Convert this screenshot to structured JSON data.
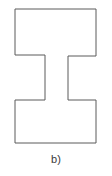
{
  "figure": {
    "caption": "b)",
    "shape_name": "i-beam-polygon",
    "stroke_color": "#5a5a5a",
    "fill_color": "#ffffff",
    "background_color": "#ffffff",
    "stroke_width": 1,
    "outline_points": "15,9 96,9 96,56 68,56 68,100 96,100 96,143 15,143 15,100 45,100 45,55 15,55",
    "vertices": [
      {
        "x": 15,
        "y": 9
      },
      {
        "x": 96,
        "y": 9
      },
      {
        "x": 96,
        "y": 56
      },
      {
        "x": 68,
        "y": 56
      },
      {
        "x": 68,
        "y": 100
      },
      {
        "x": 96,
        "y": 100
      },
      {
        "x": 96,
        "y": 143
      },
      {
        "x": 15,
        "y": 143
      },
      {
        "x": 15,
        "y": 100
      },
      {
        "x": 45,
        "y": 100
      },
      {
        "x": 45,
        "y": 55
      },
      {
        "x": 15,
        "y": 55
      }
    ]
  }
}
